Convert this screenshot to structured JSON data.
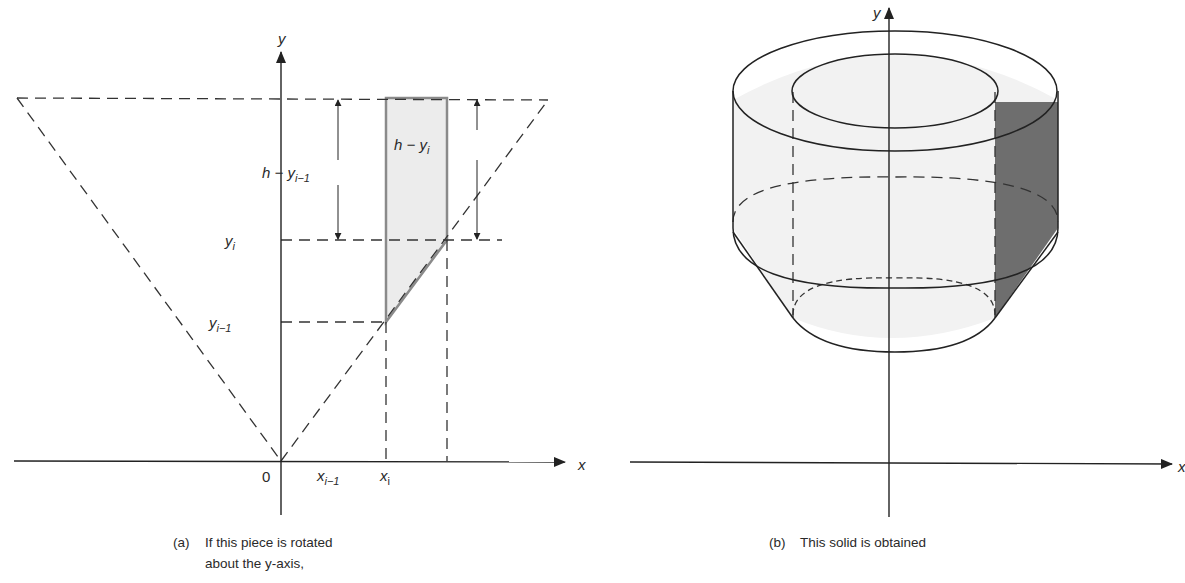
{
  "figure_a": {
    "axis_labels": {
      "y": "y",
      "x": "x",
      "origin": "0"
    },
    "y_ticks": {
      "yi": "y",
      "yi_sub": "i",
      "yi1": "y",
      "yi1_sub": "i−1"
    },
    "x_ticks": {
      "xi1": "x",
      "xi1_sub": "i−1",
      "xi": "x",
      "xi_sub": "i"
    },
    "dimensions": {
      "left": {
        "base": "h − y",
        "sub": "i−1"
      },
      "right": {
        "base": "h − y",
        "sub": "i"
      }
    },
    "caption_marker": "(a)",
    "caption_line1": "If this piece is rotated",
    "caption_line2": "about the y-axis,",
    "colors": {
      "shaded_piece": "#ececec",
      "piece_edge": "#8a8a8a"
    }
  },
  "figure_b": {
    "axis_labels": {
      "y": "y",
      "x": "x"
    },
    "caption_marker": "(b)",
    "caption_text": "This solid is obtained",
    "colors": {
      "solid_fill": "#f2f2f2",
      "cross_section": "#6e6e6e"
    }
  }
}
